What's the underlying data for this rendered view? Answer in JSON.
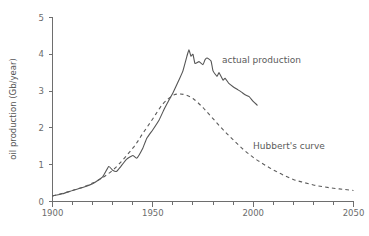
{
  "chart_data": {
    "type": "line",
    "title": "",
    "xlabel": "",
    "ylabel": "oil production (Gb/year)",
    "xlim": [
      1900,
      2050
    ],
    "ylim": [
      0,
      5
    ],
    "grid": false,
    "legend_position": "inline-annotations",
    "x_ticks_major": [
      1900,
      1950,
      2000,
      2050
    ],
    "x_tick_labels": [
      "1900",
      "1950",
      "2000",
      "2050"
    ],
    "x_ticks_minor": [
      1910,
      1920,
      1930,
      1940,
      1960,
      1970,
      1980,
      1990,
      2010,
      2020,
      2030,
      2040
    ],
    "y_ticks": [
      0,
      1,
      2,
      3,
      4,
      5
    ],
    "y_tick_labels": [
      "0",
      "1",
      "2",
      "3",
      "4",
      "5"
    ],
    "series": [
      {
        "name": "actual production",
        "style": "solid",
        "color": "#555555",
        "annotation_label": "actual production",
        "x": [
          1900,
          1905,
          1910,
          1915,
          1920,
          1925,
          1928,
          1930,
          1932,
          1934,
          1937,
          1940,
          1942,
          1945,
          1947,
          1950,
          1953,
          1956,
          1958,
          1960,
          1963,
          1965,
          1967,
          1968,
          1969,
          1970,
          1971,
          1973,
          1975,
          1976,
          1977,
          1979,
          1980,
          1982,
          1983,
          1985,
          1986,
          1988,
          1990,
          1992,
          1994,
          1996,
          1998,
          2000,
          2002
        ],
        "y": [
          0.15,
          0.21,
          0.3,
          0.38,
          0.48,
          0.67,
          0.95,
          0.85,
          0.82,
          0.95,
          1.15,
          1.25,
          1.18,
          1.45,
          1.72,
          1.95,
          2.2,
          2.55,
          2.75,
          2.95,
          3.3,
          3.55,
          3.95,
          4.12,
          3.95,
          4.0,
          3.75,
          3.8,
          3.72,
          3.85,
          3.9,
          3.82,
          3.55,
          3.4,
          3.5,
          3.3,
          3.35,
          3.2,
          3.12,
          3.05,
          2.98,
          2.9,
          2.85,
          2.72,
          2.62
        ]
      },
      {
        "name": "Hubbert's curve",
        "style": "dashed",
        "color": "#5c5c5c",
        "annotation_label": "Hubbert's curve",
        "x": [
          1900,
          1910,
          1920,
          1930,
          1940,
          1945,
          1950,
          1955,
          1960,
          1963,
          1966,
          1970,
          1975,
          1980,
          1985,
          1990,
          1995,
          2000,
          2005,
          2010,
          2015,
          2020,
          2025,
          2030,
          2035,
          2040,
          2045,
          2050
        ],
        "y": [
          0.15,
          0.3,
          0.5,
          0.85,
          1.45,
          1.85,
          2.25,
          2.65,
          2.88,
          2.92,
          2.9,
          2.8,
          2.55,
          2.25,
          1.95,
          1.68,
          1.42,
          1.2,
          1.02,
          0.86,
          0.72,
          0.6,
          0.52,
          0.45,
          0.4,
          0.36,
          0.33,
          0.3
        ]
      }
    ],
    "annotations": [
      {
        "text": "actual production",
        "x": 1986,
        "y": 3.92
      },
      {
        "text": "actual production_ignore",
        "x": 0,
        "y": 0
      },
      {
        "text": "Hubbert's curve",
        "x": 2002,
        "y": 1.56
      }
    ]
  },
  "axis": {
    "y_title": "oil production (Gb/year)"
  }
}
